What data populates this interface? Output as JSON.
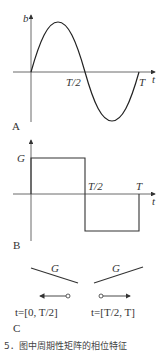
{
  "panels": {
    "A": {
      "label": "A",
      "y_axis_label": "b",
      "x_axis_label": "t",
      "ticks": [
        "T/2",
        "T"
      ],
      "curve": "sine"
    },
    "B": {
      "label": "B",
      "level_label": "G",
      "x_axis_label": "t",
      "ticks": [
        "T/2",
        "T"
      ],
      "curve": "square"
    },
    "C": {
      "label": "C",
      "left": {
        "line_label": "G",
        "interval": "t=[0, T/2]",
        "arrow_direction": "left"
      },
      "right": {
        "line_label": "G",
        "interval": "t=[T/2, T]",
        "arrow_direction": "right"
      }
    }
  },
  "caption": "5．图中周期性矩阵的相位特征"
}
